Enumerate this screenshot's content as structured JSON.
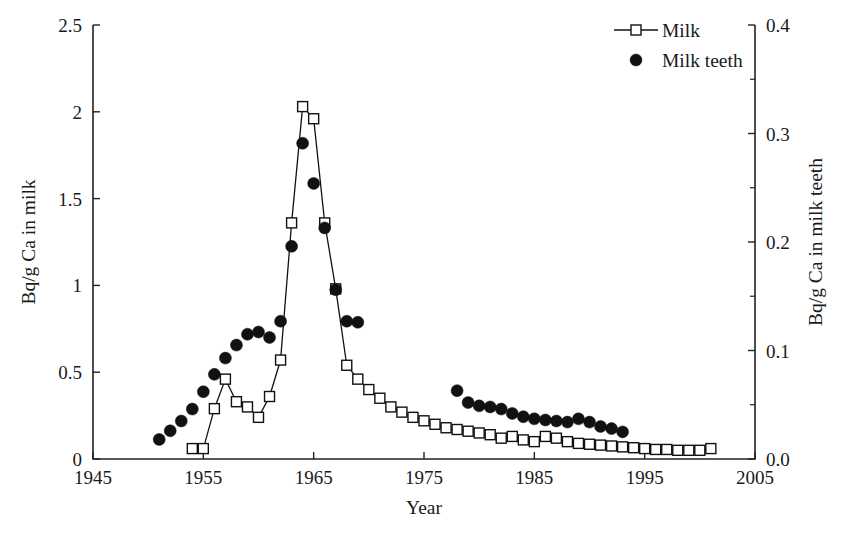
{
  "chart_data": {
    "type": "scatter",
    "title": "",
    "xlabel": "Year",
    "ylabel": "Bq/g Ca in milk",
    "y2label": "Bq/g Ca in milk teeth",
    "xlim": [
      1945,
      2005
    ],
    "ylim": [
      0,
      2.5
    ],
    "y2lim": [
      0.0,
      0.4
    ],
    "xticks": [
      1945,
      1955,
      1965,
      1975,
      1985,
      1995,
      2005
    ],
    "xticklabels": [
      "1945",
      "1955",
      "1965",
      "1975",
      "1985",
      "1995",
      "2005"
    ],
    "yticks": [
      0,
      0.5,
      1,
      1.5,
      2,
      2.5
    ],
    "yticklabels": [
      "0",
      "0.5",
      "1",
      "1.5",
      "2",
      "2.5"
    ],
    "y2ticks": [
      0.0,
      0.1,
      0.2,
      0.3,
      0.4
    ],
    "y2ticklabels": [
      "0.0",
      "0.1",
      "0.2",
      "0.3",
      "0.4"
    ],
    "y2minorticks": [
      0.05,
      0.15,
      0.25,
      0.35
    ],
    "grid": false,
    "legend_position": "top-right",
    "series": [
      {
        "name": "Milk",
        "axis": "left",
        "marker": "open-square",
        "line": true,
        "x": [
          1954,
          1955,
          1956,
          1957,
          1958,
          1959,
          1960,
          1961,
          1962,
          1963,
          1964,
          1965,
          1966,
          1967,
          1968,
          1969,
          1970,
          1971,
          1972,
          1973,
          1974,
          1975,
          1976,
          1977,
          1978,
          1979,
          1980,
          1981,
          1982,
          1983,
          1984,
          1985,
          1986,
          1987,
          1988,
          1989,
          1990,
          1991,
          1992,
          1993,
          1994,
          1995,
          1996,
          1997,
          1998,
          1999,
          2000,
          2001
        ],
        "y": [
          0.06,
          0.06,
          0.29,
          0.46,
          0.33,
          0.3,
          0.24,
          0.36,
          0.57,
          1.36,
          2.03,
          1.96,
          1.36,
          0.98,
          0.54,
          0.46,
          0.4,
          0.35,
          0.3,
          0.27,
          0.24,
          0.22,
          0.2,
          0.18,
          0.17,
          0.16,
          0.15,
          0.14,
          0.12,
          0.13,
          0.11,
          0.1,
          0.13,
          0.12,
          0.1,
          0.09,
          0.085,
          0.08,
          0.075,
          0.07,
          0.065,
          0.06,
          0.055,
          0.055,
          0.05,
          0.05,
          0.05,
          0.06
        ]
      },
      {
        "name": "Milk teeth",
        "axis": "right",
        "marker": "filled-circle",
        "line": false,
        "x": [
          1951,
          1952,
          1953,
          1954,
          1955,
          1956,
          1957,
          1958,
          1959,
          1960,
          1961,
          1962,
          1963,
          1964,
          1965,
          1966,
          1967,
          1968,
          1969,
          1978,
          1979,
          1980,
          1981,
          1982,
          1983,
          1984,
          1985,
          1986,
          1987,
          1988,
          1989,
          1990,
          1991,
          1992,
          1993
        ],
        "y": [
          0.018,
          0.026,
          0.035,
          0.046,
          0.062,
          0.078,
          0.093,
          0.105,
          0.115,
          0.117,
          0.112,
          0.127,
          0.196,
          0.291,
          0.254,
          0.213,
          0.156,
          0.127,
          0.126,
          0.063,
          0.052,
          0.049,
          0.048,
          0.046,
          0.042,
          0.039,
          0.037,
          0.036,
          0.035,
          0.034,
          0.037,
          0.034,
          0.03,
          0.028,
          0.025
        ]
      }
    ],
    "legend": [
      {
        "label": "Milk",
        "marker": "open-square",
        "line": true
      },
      {
        "label": "Milk teeth",
        "marker": "filled-circle",
        "line": false
      }
    ]
  },
  "colors": {
    "axis": "#222222",
    "line": "#111111",
    "marker_fill": "#ffffff",
    "marker_stroke": "#111111",
    "circle_fill": "#111111",
    "background": "#ffffff",
    "text": "#1a1a1a"
  }
}
